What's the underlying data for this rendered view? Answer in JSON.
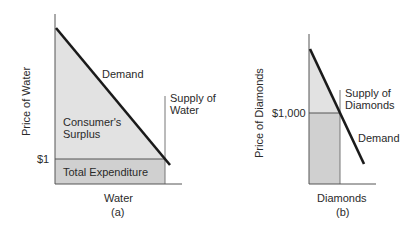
{
  "panel_a": {
    "caption": "(a)",
    "xlabel": "Water",
    "ylabel": "Price of Water",
    "price_tick": "$1",
    "demand_label": "Demand",
    "supply_label_line1": "Supply of",
    "supply_label_line2": "Water",
    "surplus_label_line1": "Consumer's",
    "surplus_label_line2": "Surplus",
    "expenditure_label": "Total Expenditure"
  },
  "panel_b": {
    "caption": "(b)",
    "xlabel": "Diamonds",
    "ylabel": "Price of Diamonds",
    "price_tick": "$1,000",
    "demand_label": "Demand",
    "supply_label_line1": "Supply of",
    "supply_label_line2": "Diamonds"
  },
  "colors": {
    "surplus_fill": "#e2e2e2",
    "expenditure_fill": "#d0d0d0",
    "line": "#1a1a1a",
    "axis": "#555555"
  }
}
